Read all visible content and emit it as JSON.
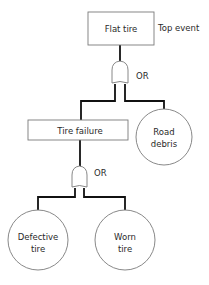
{
  "diagram": {
    "type": "fault-tree",
    "top_event": {
      "label": "Flat tire",
      "annotation": "Top event"
    },
    "gates": [
      {
        "id": "gate-1",
        "type": "OR",
        "label": "OR"
      },
      {
        "id": "gate-2",
        "type": "OR",
        "label": "OR"
      }
    ],
    "intermediate_event": {
      "label": "Tire failure"
    },
    "basic_events": [
      {
        "id": "road-debris",
        "line1": "Road",
        "line2": "debris"
      },
      {
        "id": "defective-tire",
        "line1": "Defective",
        "line2": "tire"
      },
      {
        "id": "worn-tire",
        "line1": "Worn",
        "line2": "tire"
      }
    ],
    "colors": {
      "wire": "#111111",
      "outline": "#7a7a7a",
      "text": "#2a2a2a",
      "background": "#ffffff"
    }
  }
}
